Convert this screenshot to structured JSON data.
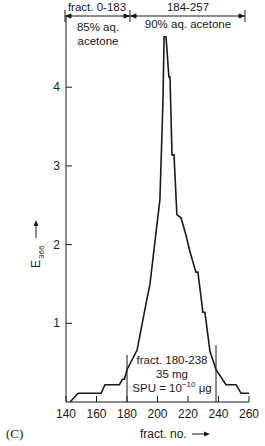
{
  "chart_data": {
    "type": "line",
    "title": "",
    "panel_label": "(C)",
    "xlabel": "fract. no.",
    "ylabel": "E 366",
    "ylabel_main": "E",
    "ylabel_sub": "366",
    "xlim": [
      140,
      260
    ],
    "ylim": [
      0,
      4.9
    ],
    "xticks": [
      140,
      160,
      180,
      200,
      220,
      240,
      260
    ],
    "yticks": [
      1,
      2,
      3,
      4
    ],
    "grid": false,
    "series": [
      {
        "name": "E366",
        "x": [
          142.6,
          148,
          163,
          165.6,
          175,
          177,
          178.3,
          180,
          186.6,
          193,
          195,
          201.6,
          203.6,
          204.3,
          205.6,
          207.5,
          208.2,
          209.5,
          210.8,
          212.7,
          215.4,
          218.7,
          221.3,
          225.2,
          226.5,
          229.8,
          231.1,
          234.4,
          238.4,
          244.9,
          251.5,
          254.8,
          260
        ],
        "values": [
          0,
          0.11,
          0.11,
          0.22,
          0.22,
          0.29,
          0.29,
          0.41,
          0.66,
          1.3,
          1.49,
          2.57,
          3.84,
          4.64,
          4.64,
          4.13,
          4.13,
          3.14,
          3.14,
          2.38,
          2.34,
          2.12,
          1.91,
          1.65,
          1.65,
          1.14,
          1.14,
          0.64,
          0.41,
          0.22,
          0.22,
          0.11,
          0.11
        ]
      }
    ],
    "annotations": {
      "top_left_range": "fract. 0-183",
      "top_left_solvent_line1": "85% aq.",
      "top_left_solvent_line2": "acetone",
      "top_right_range": "184-257",
      "top_right_solvent": "90% aq. acetone",
      "pooled_fraction_line1": "fract. 180-238",
      "pooled_fraction_line2": "35 mg",
      "pooled_fraction_line3_prefix": "SPU = 10",
      "pooled_fraction_line3_exp": "−10",
      "pooled_fraction_line3_unit": " μg",
      "pooled_range": [
        180,
        238
      ]
    },
    "colors": {
      "line": "#1a1a1a",
      "background": "#ffffff"
    }
  }
}
